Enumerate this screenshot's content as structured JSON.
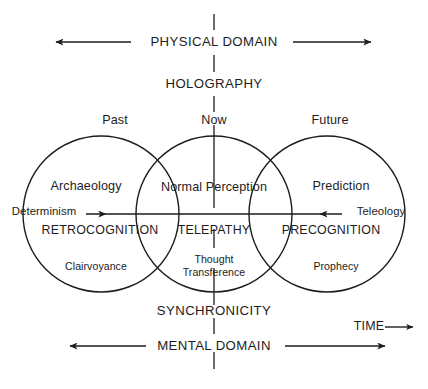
{
  "diagram": {
    "title_top": "PHYSICAL DOMAIN",
    "subtitle_top": "HOLOGRAPHY",
    "title_bottom": "MENTAL DOMAIN",
    "subtitle_bottom": "SYNCHRONICITY",
    "time_label": "TIME",
    "time_arrow": "⟶",
    "axis": {
      "left_cause": "Determinism",
      "right_cause": "Teleology"
    },
    "time_markers": [
      {
        "label": "Past"
      },
      {
        "label": "Now"
      },
      {
        "label": "Future"
      }
    ],
    "circles": [
      {
        "name": "past",
        "top_label": "Past",
        "upper_label": "Archaeology",
        "middle_label": "RETROCOGNITION",
        "lower_label": "Clairvoyance",
        "cx": 101,
        "cy": 214,
        "r": 78
      },
      {
        "name": "now",
        "top_label": "Now",
        "upper_label": "Normal Perception",
        "middle_label": "TELEPATHY",
        "lower_label_line1": "Thought",
        "lower_label_line2": "Transference",
        "cx": 214,
        "cy": 214,
        "r": 78
      },
      {
        "name": "future",
        "top_label": "Future",
        "upper_label": "Prediction",
        "middle_label": "PRECOGNITION",
        "lower_label": "Prophecy",
        "cx": 327,
        "cy": 214,
        "r": 78
      }
    ],
    "colors": {
      "stroke": "#1d1d1d",
      "text": "#1d1d1d",
      "background": "#ffffff"
    }
  }
}
